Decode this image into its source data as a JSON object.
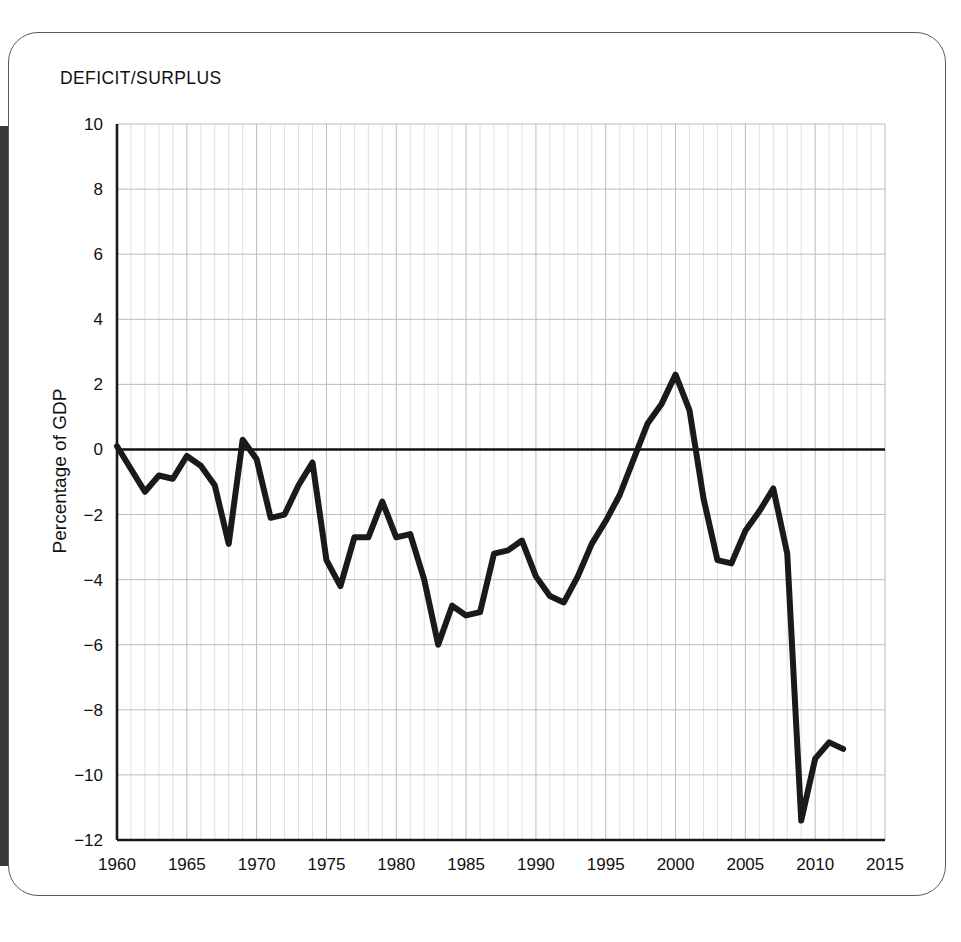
{
  "card": {
    "side_tab_label": "t"
  },
  "chart_data": {
    "type": "line",
    "title": "DEFICIT/SURPLUS",
    "xlabel": "",
    "ylabel": "Percentage of GDP",
    "xlim": [
      1960,
      2015
    ],
    "ylim": [
      -12,
      10
    ],
    "yticks": [
      10,
      8,
      6,
      4,
      2,
      0,
      -2,
      -4,
      -6,
      -8,
      -10,
      -12
    ],
    "ytick_labels": [
      "10",
      "8",
      "6",
      "4",
      "2",
      "0",
      "−2",
      "−4",
      "−6",
      "−8",
      "−10",
      "−12"
    ],
    "xticks": [
      1960,
      1965,
      1970,
      1975,
      1980,
      1985,
      1990,
      1995,
      2000,
      2005,
      2010,
      2015
    ],
    "xtick_labels": [
      "1960",
      "1965",
      "1970",
      "1975",
      "1980",
      "1985",
      "1990",
      "1995",
      "2000",
      "2005",
      "2010",
      "2015"
    ],
    "grid": "minor-yearly-vertical-and-major-horizontal",
    "grid_color": "#b9b9b9",
    "line_color": "#1a1a1a",
    "line_width": 6,
    "zero_line": true,
    "legend": "none",
    "x": [
      1960,
      1961,
      1962,
      1963,
      1964,
      1965,
      1966,
      1967,
      1968,
      1969,
      1970,
      1971,
      1972,
      1973,
      1974,
      1975,
      1976,
      1977,
      1978,
      1979,
      1980,
      1981,
      1982,
      1983,
      1984,
      1985,
      1986,
      1987,
      1988,
      1989,
      1990,
      1991,
      1992,
      1993,
      1994,
      1995,
      1996,
      1997,
      1998,
      1999,
      2000,
      2001,
      2002,
      2003,
      2004,
      2005,
      2006,
      2007,
      2008,
      2009,
      2010,
      2011,
      2012
    ],
    "values": [
      0.1,
      -0.6,
      -1.3,
      -0.8,
      -0.9,
      -0.2,
      -0.5,
      -1.1,
      -2.9,
      0.3,
      -0.3,
      -2.1,
      -2.0,
      -1.1,
      -0.4,
      -3.4,
      -4.2,
      -2.7,
      -2.7,
      -1.6,
      -2.7,
      -2.6,
      -4.0,
      -6.0,
      -4.8,
      -5.1,
      -5.0,
      -3.2,
      -3.1,
      -2.8,
      -3.9,
      -4.5,
      -4.7,
      -3.9,
      -2.9,
      -2.2,
      -1.4,
      -0.3,
      0.8,
      1.4,
      2.3,
      1.2,
      -1.5,
      -3.4,
      -3.5,
      -2.5,
      -1.9,
      -1.2,
      -3.2,
      -11.4,
      -9.5,
      -9.0,
      -9.2
    ]
  }
}
